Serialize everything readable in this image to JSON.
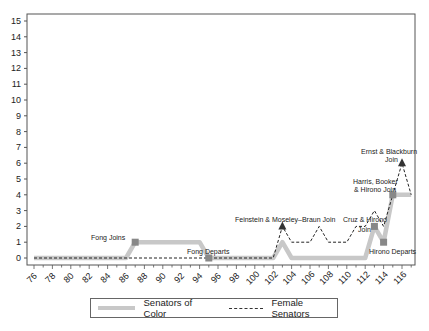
{
  "chart_data": {
    "type": "line",
    "title": "",
    "xlabel": "",
    "ylabel": "",
    "xlim": [
      76,
      117
    ],
    "ylim": [
      0,
      15
    ],
    "grid": false,
    "legend_position": "bottom",
    "x_ticks": [
      76,
      78,
      80,
      82,
      84,
      86,
      88,
      90,
      92,
      94,
      96,
      98,
      100,
      102,
      104,
      106,
      108,
      110,
      112,
      114,
      116
    ],
    "y_ticks": [
      0,
      1,
      2,
      3,
      4,
      5,
      6,
      7,
      8,
      9,
      10,
      11,
      12,
      13,
      14,
      15
    ],
    "series": [
      {
        "name": "Senators of Color",
        "style": "thick solid light gray",
        "color": "#c8c8c8",
        "points": [
          [
            76,
            0
          ],
          [
            86,
            0
          ],
          [
            87,
            1
          ],
          [
            94,
            1
          ],
          [
            95,
            0
          ],
          [
            102,
            0
          ],
          [
            103,
            1
          ],
          [
            104,
            0
          ],
          [
            112,
            0
          ],
          [
            113,
            2
          ],
          [
            114,
            1
          ],
          [
            115,
            4
          ],
          [
            117,
            4
          ]
        ]
      },
      {
        "name": "Female Senators",
        "style": "dashed black",
        "color": "#222222",
        "points": [
          [
            76,
            0
          ],
          [
            102,
            0
          ],
          [
            103,
            2
          ],
          [
            104,
            1
          ],
          [
            106,
            1
          ],
          [
            107,
            2
          ],
          [
            108,
            1
          ],
          [
            110,
            1
          ],
          [
            111,
            2
          ],
          [
            112,
            2
          ],
          [
            113,
            3
          ],
          [
            114,
            2
          ],
          [
            115,
            4
          ],
          [
            116,
            6
          ],
          [
            117,
            4
          ]
        ]
      }
    ],
    "annotations": [
      {
        "text": "Fong Joins",
        "x": 87,
        "y": 1,
        "marker": "square"
      },
      {
        "text": "Fong Departs",
        "x": 95,
        "y": 0,
        "marker": "square"
      },
      {
        "text": "Feinstein & Moseley–Braun Join",
        "x": 103,
        "y": 2,
        "marker": "triangle"
      },
      {
        "text": "Cruz & Hirono Join",
        "x": 113,
        "y": 2,
        "marker": "square"
      },
      {
        "text": "Hirono Departs",
        "x": 114,
        "y": 1,
        "marker": "square"
      },
      {
        "text": "Harris, Booker & Hirono Join",
        "x": 115,
        "y": 4,
        "marker": "square"
      },
      {
        "text": "Ernst & Blackburn Join",
        "x": 116,
        "y": 6,
        "marker": "triangle"
      }
    ]
  },
  "legend": {
    "senators_of_color": "Senators of Color",
    "female_senators": "Female Senators"
  },
  "annotations_text": {
    "fong_joins": "Fong Joins",
    "fong_departs": "Fong Departs",
    "feinstein": "Feinstein & Moseley–Braun Join",
    "cruz_line1": "Cruz & Hirono",
    "cruz_line2": "Join",
    "hirono_departs": "Hirono Departs",
    "harris_line1": "Harris, Booker",
    "harris_line2": "& Hirono Join",
    "ernst_line1": "Ernst & Blackburn",
    "ernst_line2": "Join"
  }
}
